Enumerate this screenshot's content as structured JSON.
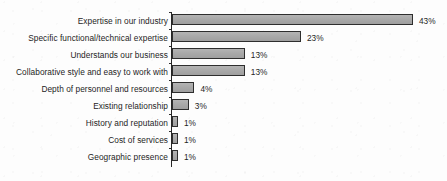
{
  "chart_data": {
    "type": "bar",
    "orientation": "horizontal",
    "title": "",
    "subtitle": "",
    "xlabel": "",
    "ylabel": "",
    "xlim": [
      0,
      43
    ],
    "grid": false,
    "legend": null,
    "value_suffix": "%",
    "categories": [
      "Expertise in our industry",
      "Specific functional/technical expertise",
      "Understands our business",
      "Collaborative style and easy to work with",
      "Depth of personnel and resources",
      "Existing relationship",
      "History and reputation",
      "Cost of services",
      "Geographic presence"
    ],
    "values": [
      43,
      23,
      13,
      13,
      4,
      3,
      1,
      1,
      1
    ],
    "data_labels": [
      "43%",
      "23%",
      "13%",
      "13%",
      "4%",
      "3%",
      "1%",
      "1%",
      "1%"
    ],
    "colors": {
      "bar_fill": "#a9a9a9",
      "bar_border": "#2e2e2e",
      "axis": "#262626",
      "text": "#1d1d1d",
      "background": "#fdfdfd"
    }
  }
}
